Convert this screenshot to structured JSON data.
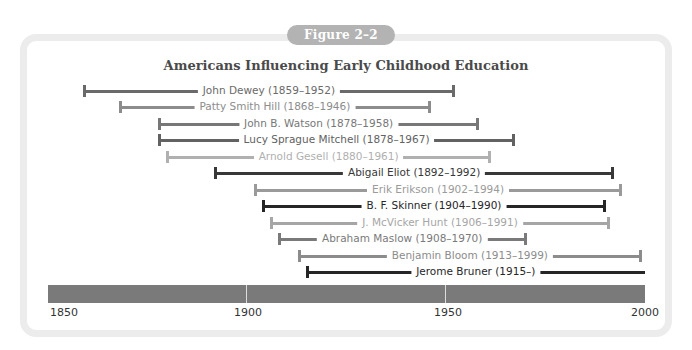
{
  "figure_label": "Figure 2–2",
  "chart_data": {
    "type": "timeline",
    "title": "Americans Influencing Early Childhood Education",
    "xlabel": "",
    "ylabel": "",
    "xlim": [
      1850,
      2000
    ],
    "x_ticks": [
      1850,
      1900,
      1950,
      2000
    ],
    "grid": false,
    "legend": null,
    "series": [
      {
        "name": "John Dewey",
        "label": "John Dewey (1859–1952)",
        "start": 1859,
        "end": 1952,
        "color": "#6a6a6a"
      },
      {
        "name": "Patty Smith Hill",
        "label": "Patty Smith Hill (1868–1946)",
        "start": 1868,
        "end": 1946,
        "color": "#8c8c8c"
      },
      {
        "name": "John B. Watson",
        "label": "John B. Watson (1878–1958)",
        "start": 1878,
        "end": 1958,
        "color": "#777777"
      },
      {
        "name": "Lucy Sprague Mitchell",
        "label": "Lucy Sprague Mitchell (1878–1967)",
        "start": 1878,
        "end": 1967,
        "color": "#626262"
      },
      {
        "name": "Arnold Gesell",
        "label": "Arnold Gesell (1880–1961)",
        "start": 1880,
        "end": 1961,
        "color": "#b0b0b0"
      },
      {
        "name": "Abigail Eliot",
        "label": "Abigail Eliot (1892–1992)",
        "start": 1892,
        "end": 1992,
        "color": "#383838"
      },
      {
        "name": "Erik Erikson",
        "label": "Erik Erikson (1902–1994)",
        "start": 1902,
        "end": 1994,
        "color": "#9a9a9a"
      },
      {
        "name": "B. F. Skinner",
        "label": "B. F. Skinner (1904–1990)",
        "start": 1904,
        "end": 1990,
        "color": "#262626"
      },
      {
        "name": "J. McVicker Hunt",
        "label": "J. McVicker Hunt (1906–1991)",
        "start": 1906,
        "end": 1991,
        "color": "#a6a6a6"
      },
      {
        "name": "Abraham Maslow",
        "label": "Abraham Maslow (1908–1970)",
        "start": 1908,
        "end": 1970,
        "color": "#7a7a7a"
      },
      {
        "name": "Benjamin Bloom",
        "label": "Benjamin Bloom (1913–1999)",
        "start": 1913,
        "end": 1999,
        "color": "#8c8c8c"
      },
      {
        "name": "Jerome Bruner",
        "label": "Jerome Bruner (1915–)",
        "start": 1915,
        "end": null,
        "color": "#262626"
      }
    ]
  },
  "axis": {
    "bar_color": "#7a7a7a",
    "tick_labels": [
      "1850",
      "1900",
      "1950",
      "2000"
    ]
  }
}
